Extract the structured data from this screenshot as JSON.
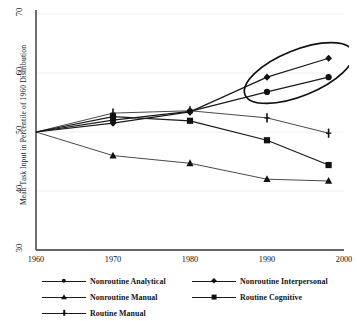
{
  "chart_data": {
    "type": "line",
    "title": "",
    "xlabel": "",
    "ylabel": "Mean Task Input in Percentile of 1960 Distribution",
    "x": [
      1960,
      1970,
      1980,
      1990,
      1998
    ],
    "xlim": [
      1960,
      2000
    ],
    "ylim": [
      30,
      70
    ],
    "xticks": [
      "1960",
      "1970",
      "1980",
      "1990",
      "2000"
    ],
    "xtick_values": [
      1960,
      1970,
      1980,
      1990,
      2000
    ],
    "yticks": [
      "30",
      "40",
      "50",
      "60",
      "70"
    ],
    "ytick_values": [
      30,
      40,
      50,
      60,
      70
    ],
    "grid": true,
    "legend_position": "below",
    "series": [
      {
        "name": "Nonroutine Analytical",
        "marker": "circle",
        "values": [
          50.0,
          52.0,
          53.5,
          56.8,
          59.3
        ]
      },
      {
        "name": "Nonroutine Interpersonal",
        "marker": "diamond",
        "values": [
          50.0,
          51.5,
          53.4,
          59.3,
          62.5
        ]
      },
      {
        "name": "Nonroutine Manual",
        "marker": "triangle",
        "values": [
          50.0,
          46.0,
          44.7,
          42.0,
          41.7
        ]
      },
      {
        "name": "Routine Cognitive",
        "marker": "square",
        "values": [
          50.0,
          52.6,
          51.9,
          48.6,
          44.4
        ]
      },
      {
        "name": "Routine Manual",
        "marker": "plus",
        "values": [
          50.0,
          53.2,
          53.6,
          52.4,
          49.8
        ]
      }
    ],
    "annotations": [
      {
        "type": "ellipse",
        "name": "highlight-ellipse",
        "label": "",
        "encircles": [
          "Nonroutine Interpersonal",
          "Nonroutine Analytical"
        ],
        "x_range": [
          1988,
          2000
        ],
        "y_range": [
          55.5,
          64.5
        ]
      }
    ],
    "colors": {
      "line": "#1a1a1a",
      "marker": "#111111",
      "grid": "#efefef",
      "axis": "#333333",
      "background": "#ffffff"
    }
  },
  "legend": {
    "entries": [
      {
        "label": "Nonroutine Analytical",
        "marker": "circle"
      },
      {
        "label": "Nonroutine Interpersonal",
        "marker": "diamond"
      },
      {
        "label": "Nonroutine Manual",
        "marker": "triangle"
      },
      {
        "label": "Routine Cognitive",
        "marker": "square"
      },
      {
        "label": "Routine Manual",
        "marker": "plus"
      }
    ]
  }
}
